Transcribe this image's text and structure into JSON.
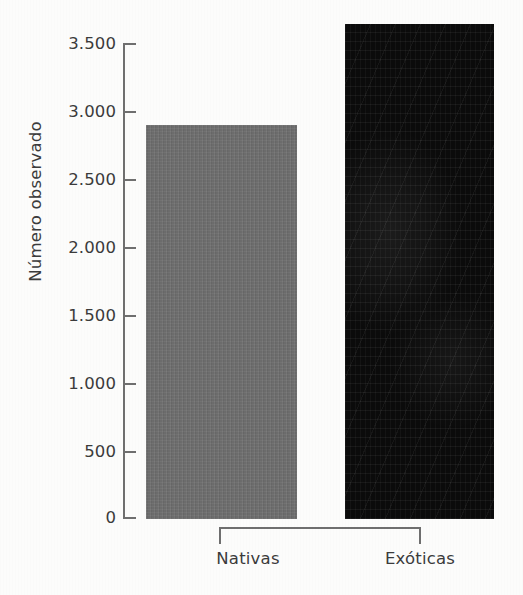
{
  "chart_data": {
    "type": "bar",
    "title": "",
    "xlabel": "",
    "ylabel": "Número observado",
    "categories": [
      "Nativas",
      "Exóticas"
    ],
    "values": [
      2900,
      3640
    ],
    "series": [
      {
        "name": "Número observado",
        "values": [
          2900,
          3640
        ],
        "colors": [
          "#6e6e6e",
          "#0b0b0b"
        ]
      }
    ],
    "ylim": [
      0,
      3500
    ],
    "y_ticks": [
      0,
      500,
      1000,
      1500,
      2000,
      2500,
      3000,
      3500
    ],
    "y_tick_labels": [
      "0",
      "500",
      "1.000",
      "1.500",
      "2.000",
      "2.500",
      "3.000",
      "3.500"
    ],
    "grid": false,
    "legend": false,
    "legend_position": "none",
    "thousands_separator": "."
  },
  "axes": {
    "y_title": "Número observado",
    "ticks": [
      {
        "label": "3.500",
        "value": 3500
      },
      {
        "label": "3.000",
        "value": 3000
      },
      {
        "label": "2.500",
        "value": 2500
      },
      {
        "label": "2.000",
        "value": 2000
      },
      {
        "label": "1.500",
        "value": 1500
      },
      {
        "label": "1.000",
        "value": 1000
      },
      {
        "label": "500",
        "value": 500
      },
      {
        "label": "0",
        "value": 0
      }
    ]
  },
  "bars": [
    {
      "label": "Nativas",
      "value": 2900,
      "color": "#6e6e6e"
    },
    {
      "label": "Exóticas",
      "value": 3640,
      "color": "#0b0b0b"
    }
  ],
  "colors": {
    "background": "#fcfcfb",
    "axis": "#6f6f6f",
    "text": "#3b3b3b",
    "bar_native": "#6e6e6e",
    "bar_exotic": "#0b0b0b"
  }
}
